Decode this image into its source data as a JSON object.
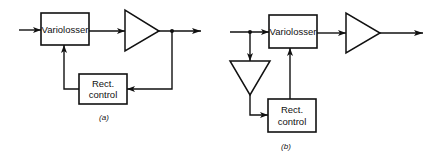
{
  "diagram_a": {
    "variolosser_label": "Variolosser",
    "rect_label_line1": "Rect.",
    "rect_label_line2": "control",
    "caption": "(a)"
  },
  "diagram_b": {
    "variolosser_label": "Variolosser",
    "rect_label_line1": "Rect.",
    "rect_label_line2": "control",
    "caption": "(b)"
  },
  "colors": {
    "stroke": "#111111",
    "background": "#ffffff"
  }
}
